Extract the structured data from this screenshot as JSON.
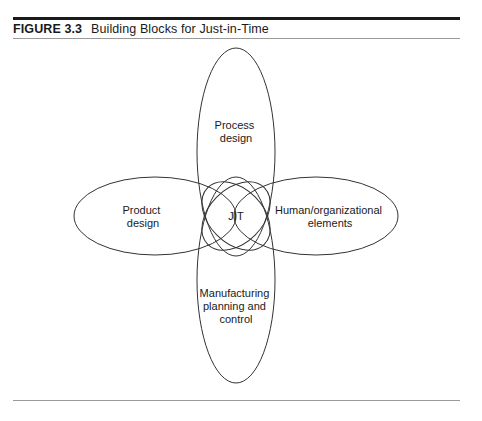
{
  "figure": {
    "number": "FIGURE 3.3",
    "title": "Building Blocks for Just-in-Time"
  },
  "diagram": {
    "center": {
      "label": "JIT"
    },
    "blocks": [
      {
        "id": "top",
        "lines": [
          "Process",
          "design"
        ]
      },
      {
        "id": "left",
        "lines": [
          "Product",
          "design"
        ]
      },
      {
        "id": "right",
        "lines": [
          "Human/organizational",
          "elements"
        ]
      },
      {
        "id": "bottom",
        "lines": [
          "Manufacturing",
          "planning and",
          "control"
        ]
      }
    ]
  },
  "colors": {
    "stroke": "#333333",
    "text": "#1a1a1a",
    "rule": "#1a1a1a",
    "thin_rule": "#9a9a9a"
  }
}
